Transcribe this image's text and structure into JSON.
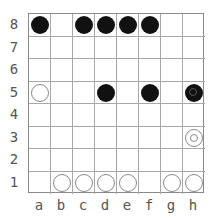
{
  "game": {
    "type": "board-8x8",
    "columns": [
      "a",
      "b",
      "c",
      "d",
      "e",
      "f",
      "g",
      "h"
    ],
    "rows": [
      "8",
      "7",
      "6",
      "5",
      "4",
      "3",
      "2",
      "1"
    ],
    "pieces": [
      {
        "square": "a8",
        "color": "black",
        "marked": false
      },
      {
        "square": "c8",
        "color": "black",
        "marked": false
      },
      {
        "square": "d8",
        "color": "black",
        "marked": false
      },
      {
        "square": "e8",
        "color": "black",
        "marked": false
      },
      {
        "square": "f8",
        "color": "black",
        "marked": false
      },
      {
        "square": "a5",
        "color": "white",
        "marked": false
      },
      {
        "square": "d5",
        "color": "black",
        "marked": false
      },
      {
        "square": "f5",
        "color": "black",
        "marked": false
      },
      {
        "square": "h5",
        "color": "black",
        "marked": true
      },
      {
        "square": "h3",
        "color": "white",
        "marked": true
      },
      {
        "square": "b1",
        "color": "white",
        "marked": false
      },
      {
        "square": "c1",
        "color": "white",
        "marked": false
      },
      {
        "square": "d1",
        "color": "white",
        "marked": false
      },
      {
        "square": "e1",
        "color": "white",
        "marked": false
      },
      {
        "square": "g1",
        "color": "white",
        "marked": false
      },
      {
        "square": "h1",
        "color": "white",
        "marked": false
      }
    ]
  },
  "colors": {
    "black": "#111111",
    "white": "#ffffff",
    "grid": "#a8a8a8",
    "label": "#555555"
  }
}
